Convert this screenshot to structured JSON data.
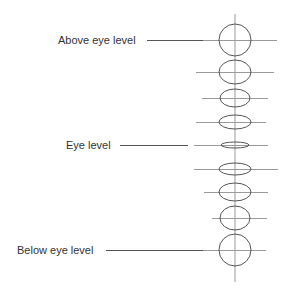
{
  "labels": {
    "above": "Above eye level",
    "eye": "Eye level",
    "below": "Below eye level"
  },
  "colors": {
    "text": "#333333",
    "leader_line": "#555555",
    "ellipse_stroke": "#555555",
    "guide_line": "#9a9a9a"
  },
  "axis": {
    "x": 235,
    "y_top": 14,
    "y_bottom": 282
  },
  "ellipses": [
    {
      "cy": 40,
      "rx": 16,
      "ry": 16,
      "h_left": 203,
      "h_right": 277
    },
    {
      "cy": 72,
      "rx": 16,
      "ry": 12,
      "h_left": 196,
      "h_right": 274
    },
    {
      "cy": 98,
      "rx": 15,
      "ry": 9,
      "h_left": 202,
      "h_right": 268
    },
    {
      "cy": 122,
      "rx": 16,
      "ry": 7,
      "h_left": 196,
      "h_right": 266
    },
    {
      "cy": 145,
      "rx": 14,
      "ry": 3,
      "h_left": 194,
      "h_right": 268
    },
    {
      "cy": 169,
      "rx": 16,
      "ry": 6,
      "h_left": 194,
      "h_right": 278
    },
    {
      "cy": 192,
      "rx": 16,
      "ry": 9,
      "h_left": 204,
      "h_right": 268
    },
    {
      "cy": 218,
      "rx": 15,
      "ry": 12,
      "h_left": 212,
      "h_right": 267
    },
    {
      "cy": 250,
      "rx": 16,
      "ry": 16,
      "h_left": 203,
      "h_right": 266
    }
  ]
}
